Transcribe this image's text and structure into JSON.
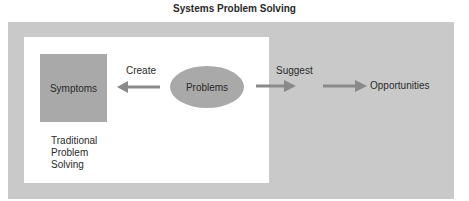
{
  "title": "Systems Problem Solving",
  "nodes": {
    "symptoms": "Symptoms",
    "problems": "Problems",
    "opportunities": "Opportunities"
  },
  "edges": {
    "create": "Create",
    "suggest": "Suggest"
  },
  "region_label": [
    "Traditional",
    "Problem",
    "Solving"
  ],
  "colors": {
    "outer": "#c9c9c9",
    "node": "#a9a9a9",
    "arrow": "#8a8a8a"
  }
}
